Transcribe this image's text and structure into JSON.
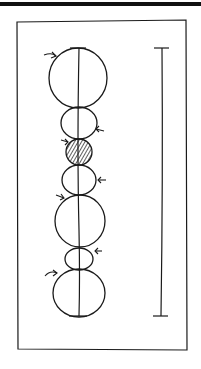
{
  "figure": {
    "kind": "hand-drawn sketch",
    "stroke_color": "#1a1a1a",
    "background": "#ffffff",
    "frame": {
      "x": 17,
      "y": 21,
      "w": 170,
      "h": 329
    },
    "axis_line": {
      "x": 79,
      "y1": 48,
      "y2": 316
    },
    "segments": [
      {
        "id": "seg1",
        "cy": 78,
        "rx": 29,
        "ry": 30,
        "hatched": false,
        "arrow": "left-curved"
      },
      {
        "id": "seg2",
        "cy": 123,
        "rx": 18,
        "ry": 16,
        "hatched": false,
        "arrow": "right"
      },
      {
        "id": "seg3",
        "cy": 152,
        "rx": 13,
        "ry": 13,
        "hatched": true,
        "arrow": "left"
      },
      {
        "id": "seg4",
        "cy": 180,
        "rx": 17,
        "ry": 15,
        "hatched": false,
        "arrow": "right"
      },
      {
        "id": "seg5",
        "cy": 221,
        "rx": 25,
        "ry": 26,
        "hatched": false,
        "arrow": "left"
      },
      {
        "id": "seg6",
        "cy": 259,
        "rx": 14,
        "ry": 11,
        "hatched": false,
        "arrow": "right"
      },
      {
        "id": "seg7",
        "cy": 293,
        "rx": 26,
        "ry": 24,
        "hatched": false,
        "arrow": "left-curved"
      }
    ],
    "scale_bar": {
      "x": 162,
      "y1": 48,
      "y2": 316,
      "cap_width": 14
    }
  }
}
